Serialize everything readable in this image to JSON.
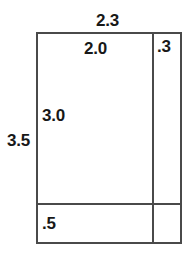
{
  "figure": {
    "stroke_color": "#4a4a4a",
    "text_color": "#181818",
    "background_color": "#ffffff"
  },
  "labels": {
    "overall_width": "2.3",
    "inner_width": "2.0",
    "right_strip_width": ".3",
    "overall_height": "3.5",
    "inner_height": "3.0",
    "bottom_strip_height": ".5"
  },
  "chart_data": {
    "type": "diagram",
    "shape": "rectangle",
    "units": "unitless",
    "overall": {
      "width": 2.3,
      "height": 3.5
    },
    "subdivisions": {
      "columns": [
        {
          "name": "main-column",
          "width": 2.0,
          "label": "2.0"
        },
        {
          "name": "right-strip",
          "width": 0.3,
          "label": ".3"
        }
      ],
      "rows": [
        {
          "name": "main-row",
          "height": 3.0,
          "label": "3.0"
        },
        {
          "name": "bottom-strip",
          "height": 0.5,
          "label": ".5"
        }
      ]
    },
    "annotations": [
      {
        "text": "2.3",
        "position": "top-outside",
        "refers_to": "overall width"
      },
      {
        "text": "2.0",
        "position": "top-inside",
        "refers_to": "main column width"
      },
      {
        "text": ".3",
        "position": "top-right-cell",
        "refers_to": "right strip width"
      },
      {
        "text": "3.5",
        "position": "left-outside",
        "refers_to": "overall height"
      },
      {
        "text": "3.0",
        "position": "left-inside",
        "refers_to": "main row height"
      },
      {
        "text": ".5",
        "position": "bottom-left-cell",
        "refers_to": "bottom strip height"
      }
    ]
  }
}
